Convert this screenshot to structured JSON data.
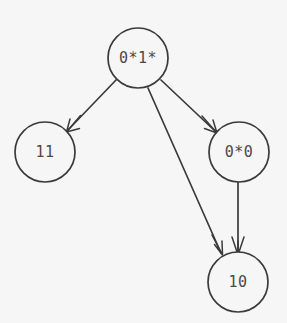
{
  "graph": {
    "background_color": "#f7f6f6",
    "stroke_color": "#3a3a3c",
    "label_color": "#4a4a4c",
    "nodes": [
      {
        "id": "root",
        "label": "0*1*",
        "cx": 138,
        "cy": 58,
        "r": 30
      },
      {
        "id": "left",
        "label": "11",
        "cx": 45,
        "cy": 152,
        "r": 30
      },
      {
        "id": "right",
        "label": "0*0",
        "cx": 239,
        "cy": 152,
        "r": 30
      },
      {
        "id": "bottom",
        "label": "10",
        "cx": 238,
        "cy": 282,
        "r": 30
      }
    ],
    "edges": [
      {
        "id": "root-to-left",
        "from": "root",
        "to": "left",
        "x1": 117,
        "y1": 79,
        "x2": 68,
        "y2": 130,
        "arrow": "open-v"
      },
      {
        "id": "root-to-right",
        "from": "root",
        "to": "right",
        "x1": 161,
        "y1": 80,
        "x2": 215,
        "y2": 131,
        "arrow": "open-v"
      },
      {
        "id": "root-to-bottom",
        "from": "root",
        "to": "bottom",
        "x1": 148,
        "y1": 88,
        "x2": 221,
        "y2": 253,
        "arrow": "open-v"
      },
      {
        "id": "right-to-bottom",
        "from": "right",
        "to": "bottom",
        "x1": 238,
        "y1": 182,
        "x2": 238,
        "y2": 253,
        "arrow": "open-v"
      }
    ]
  }
}
